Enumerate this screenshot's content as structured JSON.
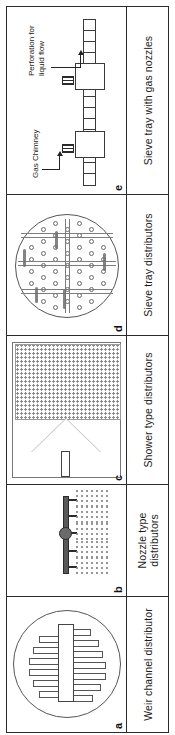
{
  "figure": {
    "orientation": "rotated-90-ccw",
    "panels": [
      {
        "tag": "a",
        "caption": "Weir channel distributor",
        "art": "circular-tray-with-weir-channel-and-fins"
      },
      {
        "tag": "b",
        "caption": "Nozzle type distributors",
        "art": "horizontal-pipe-with-spray-nozzles"
      },
      {
        "tag": "c",
        "caption": "Shower type distributors",
        "art": "feed-pipe-cone-and-shower-droplet-field"
      },
      {
        "tag": "d",
        "caption": "Sieve tray distributors",
        "art": "circular-sieve-tray-with-hole-grid-and-channels"
      },
      {
        "tag": "e",
        "caption": "Sieve tray with gas nozzles",
        "art": "sieve-tray-cross-section-with-gas-chimneys",
        "annotations": [
          {
            "id": "gas-chimney",
            "text": "Gas Chimney"
          },
          {
            "id": "perforation",
            "text": "Perforation for\nliquid flow"
          }
        ]
      }
    ]
  },
  "colors": {
    "ink": "#1a1a1a",
    "rule": "#2b2b2b",
    "line": "#555555",
    "fill_gray": "#6a6a6a",
    "dot_gray": "#8c8c8c",
    "background": "#ffffff"
  }
}
